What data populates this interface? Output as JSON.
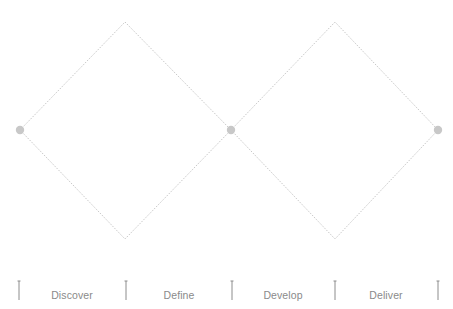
{
  "diagram": {
    "colors": {
      "line": "#b0b0b0",
      "node": "#c8c8c8",
      "tick": "#8c8c8c",
      "label": "#8a8a8a",
      "background": "#ffffff"
    },
    "diamonds": [
      {
        "left": [
          20,
          130
        ],
        "top": [
          125,
          22
        ],
        "right": [
          231,
          130
        ],
        "bottom": [
          125,
          239
        ]
      },
      {
        "left": [
          231,
          130
        ],
        "top": [
          335,
          22
        ],
        "right": [
          438,
          130
        ],
        "bottom": [
          335,
          239
        ]
      }
    ],
    "nodes": [
      {
        "x": 20,
        "y": 130
      },
      {
        "x": 231,
        "y": 130
      },
      {
        "x": 438,
        "y": 130
      }
    ],
    "ticks": [
      19,
      126,
      232,
      335,
      438
    ],
    "phases": [
      {
        "label": "Discover",
        "x": 72
      },
      {
        "label": "Define",
        "x": 179
      },
      {
        "label": "Develop",
        "x": 283
      },
      {
        "label": "Deliver",
        "x": 386
      }
    ]
  }
}
